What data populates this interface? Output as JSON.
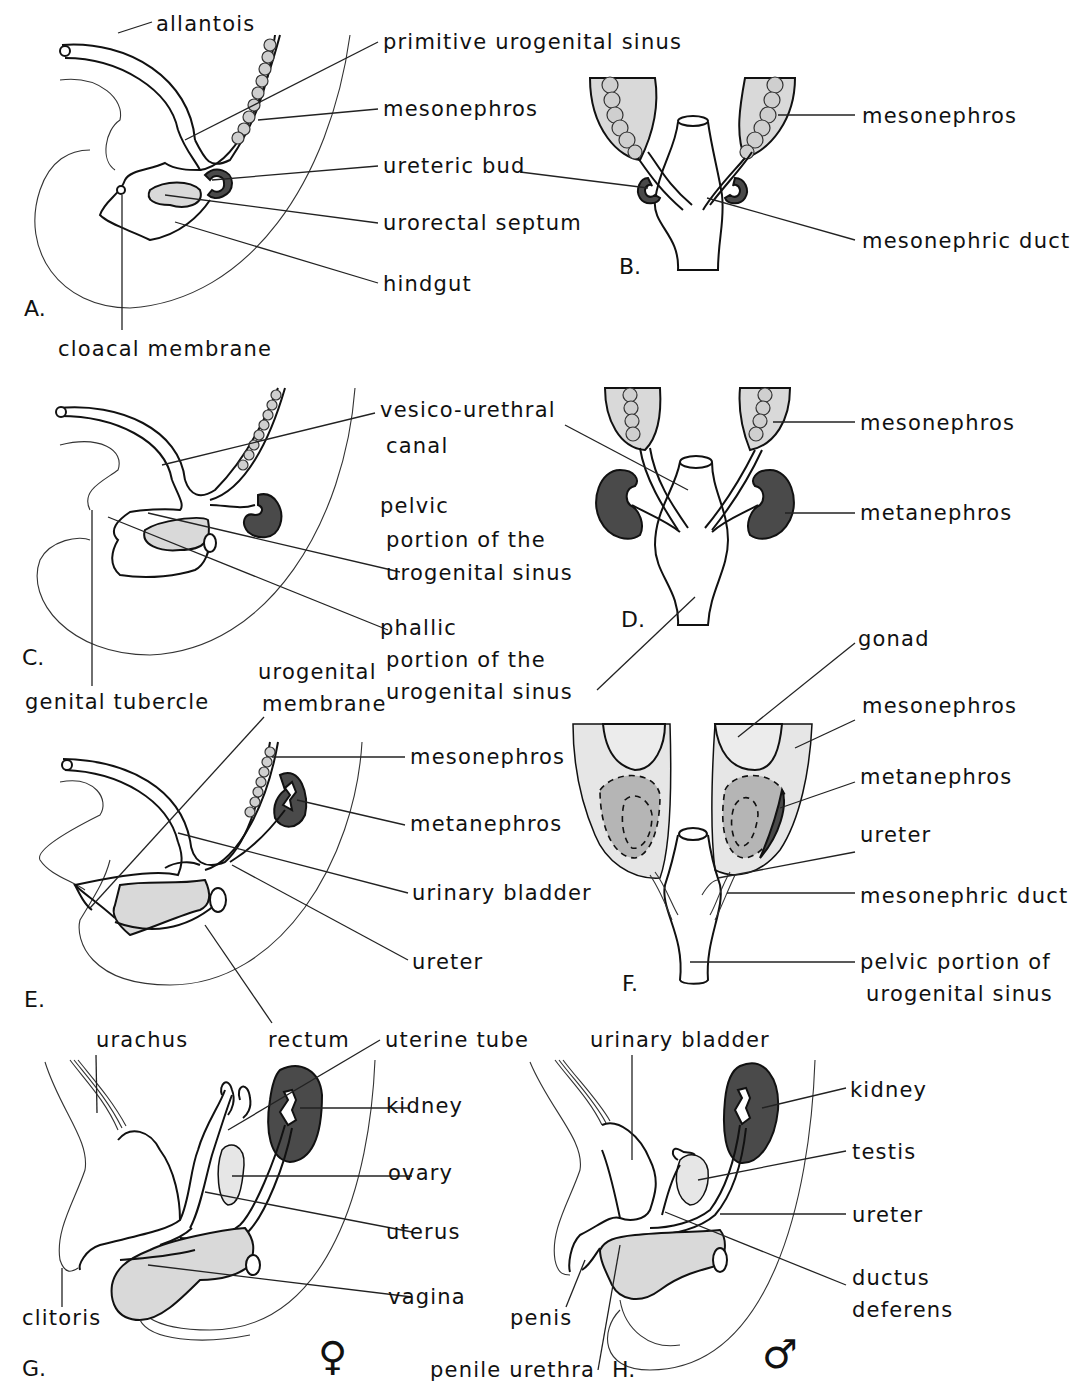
{
  "figure": {
    "panels": {
      "A": {
        "letter": "A.",
        "labels": {
          "allantois": "allantois",
          "primitive_urogenital_sinus": "primitive urogenital sinus",
          "mesonephros": "mesonephros",
          "ureteric_bud": "ureteric bud",
          "urorectal_septum": "urorectal septum",
          "hindgut": "hindgut",
          "cloacal_membrane": "cloacal membrane"
        }
      },
      "B": {
        "letter": "B.",
        "labels": {
          "mesonephros": "mesonephros",
          "mesonephric_duct": "mesonephric duct"
        }
      },
      "C": {
        "letter": "C.",
        "labels": {
          "vesico_urethral_1": "vesico-urethral",
          "vesico_urethral_2": "canal",
          "pelvic_1": "pelvic",
          "pelvic_2": "portion of the",
          "pelvic_3": "urogenital sinus",
          "phallic_1": "phallic",
          "phallic_2": "portion of the",
          "phallic_3": "urogenital sinus",
          "genital_tubercle": "genital tubercle"
        }
      },
      "D": {
        "letter": "D.",
        "labels": {
          "mesonephros": "mesonephros",
          "metanephros": "metanephros"
        }
      },
      "E": {
        "letter": "E.",
        "labels": {
          "urogenital_membrane_1": "urogenital",
          "urogenital_membrane_2": "membrane",
          "mesonephros": "mesonephros",
          "metanephros": "metanephros",
          "urinary_bladder": "urinary bladder",
          "ureter": "ureter",
          "rectum": "rectum"
        }
      },
      "F": {
        "letter": "F.",
        "labels": {
          "gonad": "gonad",
          "mesonephros": "mesonephros",
          "metanephros": "metanephros",
          "ureter": "ureter",
          "mesonephric_duct": "mesonephric duct",
          "pelvic_portion_1": "pelvic portion of",
          "pelvic_portion_2": "urogenital sinus"
        }
      },
      "G": {
        "letter": "G.",
        "sex_symbol": "♀",
        "labels": {
          "urachus": "urachus",
          "uterine_tube": "uterine tube",
          "kidney": "kidney",
          "ovary": "ovary",
          "uterus": "uterus",
          "vagina": "vagina",
          "clitoris": "clitoris"
        }
      },
      "H": {
        "letter": "H.",
        "sex_symbol": "♂",
        "labels": {
          "urinary_bladder": "urinary bladder",
          "kidney": "kidney",
          "testis": "testis",
          "ureter": "ureter",
          "ductus_1": "ductus",
          "ductus_2": "deferens",
          "penis": "penis",
          "penile_urethra": "penile urethra"
        }
      }
    },
    "colors": {
      "ink": "#111111",
      "light_fill": "#d9d9d9",
      "dark_fill": "#4a4a4a",
      "background": "#ffffff"
    }
  }
}
